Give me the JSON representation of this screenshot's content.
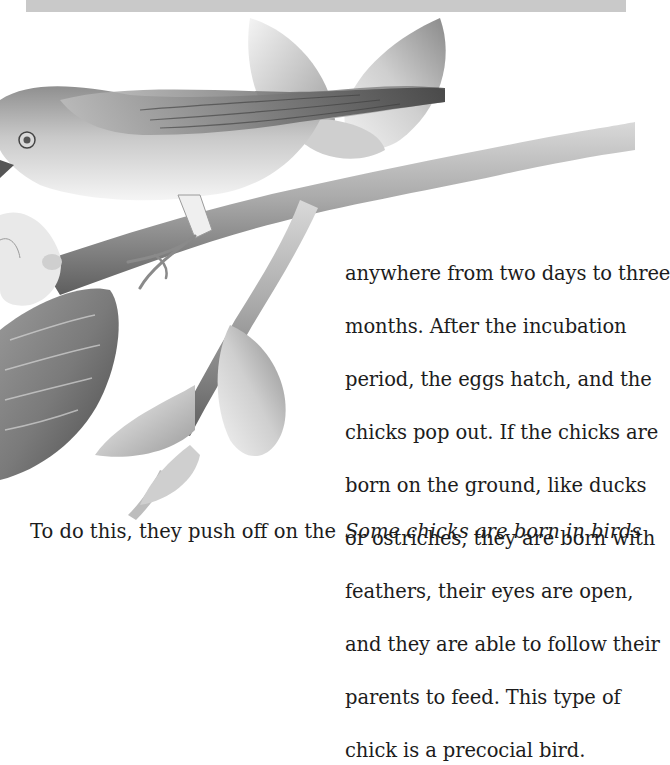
{
  "page": {
    "header_bar_color": "#c9c9c9",
    "background_color": "#ffffff"
  },
  "illustration": {
    "subject": "bird-feeding-chicks-in-nest-on-branch",
    "style": "grayscale"
  },
  "body_text": {
    "lines": [
      "anywhere from two days to three",
      "months.  After the incubation",
      "period, the eggs hatch, and the",
      "chicks pop out.  If the chicks are",
      "born on the ground, like ducks",
      "or ostriches, they are born with",
      "feathers, their eyes are open,",
      "and they are able to follow their",
      "parents to feed.  This type of",
      "chick is a precocial bird."
    ]
  },
  "bottom_text": {
    "left_partial": "To do this, they push off on the",
    "right_partial": "Some chicks are born in birds"
  }
}
